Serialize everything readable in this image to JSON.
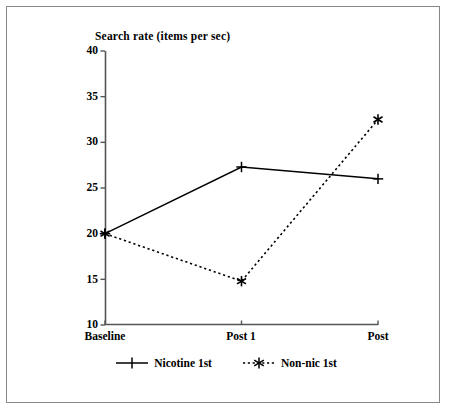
{
  "chart_data": {
    "type": "line",
    "title": "Search rate (items per sec)",
    "xlabel": "",
    "ylabel": "",
    "categories": [
      "Baseline",
      "Post 1",
      "Post"
    ],
    "yticks": [
      10,
      15,
      20,
      25,
      30,
      35,
      40
    ],
    "ylim": [
      10,
      40
    ],
    "grid": false,
    "legend_position": "bottom-center",
    "series": [
      {
        "name": "Nicotine 1st",
        "values": [
          20.0,
          27.3,
          26.0
        ],
        "linestyle": "solid",
        "marker": "plus",
        "color": "#000000"
      },
      {
        "name": "Non-nic 1st",
        "values": [
          20.0,
          14.8,
          32.5
        ],
        "linestyle": "dotted",
        "marker": "asterisk",
        "color": "#000000"
      }
    ]
  },
  "figure": {
    "frame_color": "#888888",
    "axis_color": "#555555",
    "background": "#ffffff"
  },
  "legend": {
    "entries": [
      {
        "label": "Nicotine 1st",
        "marker": "plus-marker-icon"
      },
      {
        "label": "Non-nic 1st",
        "marker": "asterisk-marker-icon"
      }
    ]
  },
  "ticks": {
    "y": [
      "40",
      "35",
      "30",
      "25",
      "20",
      "15",
      "10"
    ],
    "x": [
      "Baseline",
      "Post 1",
      "Post"
    ]
  }
}
